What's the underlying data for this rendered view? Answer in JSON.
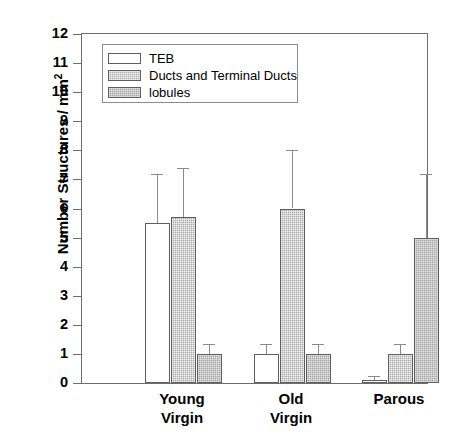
{
  "chart_data": {
    "type": "bar",
    "title": "",
    "subtitle": "",
    "xlabel": "",
    "ylabel": "Number Structures / mm2",
    "ylabel_base": "Number Structures / mm",
    "ylabel_exponent": "2",
    "categories": [
      "Young Virgin",
      "Old Virgin",
      "Parous"
    ],
    "category_lines": [
      [
        "Young",
        "Virgin"
      ],
      [
        "Old",
        "Virgin"
      ],
      [
        "Parous"
      ]
    ],
    "ylim": [
      0,
      12
    ],
    "ytick_values": [
      0,
      1,
      2,
      3,
      4,
      5,
      6,
      7,
      8,
      9,
      10,
      11,
      12
    ],
    "ytick_labels": [
      "0",
      "1",
      "2",
      "3",
      "4",
      "5",
      "6",
      "7",
      "8",
      "9",
      "10",
      "11",
      "12"
    ],
    "grid": false,
    "legend_position": "upper-left-inside",
    "error_bars": "upper only (SEM/SD caps)",
    "series": [
      {
        "name": "TEB",
        "color": "#ffffff",
        "values": [
          5.5,
          1.0,
          0.1
        ],
        "errors_upper": [
          1.7,
          0.35,
          0.15
        ]
      },
      {
        "name": "Ducts and Terminal Ducts",
        "color": "#adadad",
        "values": [
          5.7,
          6.0,
          1.0
        ],
        "errors_upper": [
          1.7,
          2.0,
          0.35
        ]
      },
      {
        "name": "lobules",
        "color": "#a3a3a3",
        "values": [
          1.0,
          1.0,
          5.0
        ],
        "errors_upper": [
          0.35,
          0.35,
          2.2
        ]
      }
    ]
  },
  "legend": {
    "items": [
      {
        "label": "TEB",
        "swatch": "white-box-swatch"
      },
      {
        "label": "Ducts and Terminal Ducts",
        "swatch": "gray-stipple-swatch"
      },
      {
        "label": "lobules",
        "swatch": "gray-stipple-swatch"
      }
    ]
  },
  "axis": {
    "y_title_base": "Number Structures / mm",
    "y_title_exponent": "2"
  }
}
